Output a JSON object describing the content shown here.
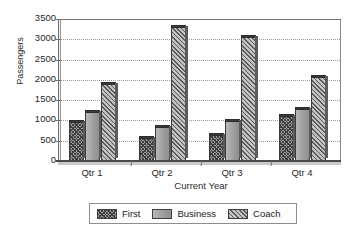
{
  "chart_data": {
    "type": "bar",
    "title": "",
    "xlabel": "Current Year",
    "ylabel": "Passengers",
    "categories": [
      "Qtr 1",
      "Qtr 2",
      "Qtr 3",
      "Qtr 4"
    ],
    "series": [
      {
        "name": "First",
        "values": [
          950,
          570,
          650,
          1100
        ]
      },
      {
        "name": "Business",
        "values": [
          1200,
          850,
          980,
          1280
        ]
      },
      {
        "name": "Coach",
        "values": [
          1900,
          3300,
          3050,
          2080
        ]
      }
    ],
    "ylim": [
      0,
      3500
    ],
    "ytick_labels": [
      "0",
      "500",
      "1000",
      "1500",
      "2000",
      "2500",
      "3000",
      "3500"
    ],
    "ytick_values": [
      0,
      500,
      1000,
      1500,
      2000,
      2500,
      3000,
      3500
    ],
    "grid": true,
    "legend_position": "bottom",
    "legend_entries": [
      {
        "label": "First",
        "swatch": "dark-crosshatch"
      },
      {
        "label": "Business",
        "swatch": "solid-gray"
      },
      {
        "label": "Coach",
        "swatch": "light-diagonal-hatch"
      }
    ],
    "colors": {
      "first": "#9e9e9e",
      "business": "#a6a6a6",
      "coach": "#c2c2c2",
      "axis": "#4a4a4a",
      "grid": "#9b9b9b",
      "background": "#ffffff"
    }
  }
}
